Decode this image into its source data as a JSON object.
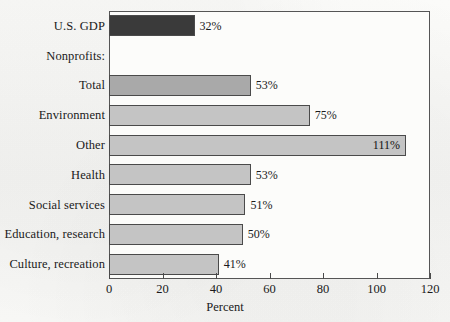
{
  "chart_data": {
    "type": "bar",
    "orientation": "horizontal",
    "title": "",
    "subtitle": "",
    "xlabel": "Percent",
    "ylabel": "",
    "xlim": [
      0,
      120
    ],
    "xticks": [
      0,
      20,
      40,
      60,
      80,
      100,
      120
    ],
    "xtick_labels": [
      "0",
      "20",
      "40",
      "60",
      "80",
      "100",
      "120"
    ],
    "grid": false,
    "legend": false,
    "categories": [
      "U.S. GDP",
      "Nonprofits:",
      "Total",
      "Environment",
      "Other",
      "Health",
      "Social services",
      "Education, research",
      "Culture, recreation"
    ],
    "values": [
      32,
      null,
      53,
      75,
      111,
      53,
      51,
      50,
      41
    ],
    "value_labels": [
      "32%",
      "",
      "53%",
      "75%",
      "111%",
      "53%",
      "51%",
      "50%",
      "41%"
    ],
    "bars": [
      {
        "label": "U.S. GDP",
        "value": 32,
        "value_label": "32%",
        "color": "#3a3a3a",
        "label_position": "outside",
        "is_header": false
      },
      {
        "label": "Nonprofits:",
        "value": null,
        "value_label": "",
        "color": "",
        "label_position": "none",
        "is_header": true
      },
      {
        "label": "Total",
        "value": 53,
        "value_label": "53%",
        "color": "#a9a9a9",
        "label_position": "outside",
        "is_header": false
      },
      {
        "label": "Environment",
        "value": 75,
        "value_label": "75%",
        "color": "#c4c4c4",
        "label_position": "outside",
        "is_header": false
      },
      {
        "label": "Other",
        "value": 111,
        "value_label": "111%",
        "color": "#c4c4c4",
        "label_position": "inside",
        "is_header": false
      },
      {
        "label": "Health",
        "value": 53,
        "value_label": "53%",
        "color": "#c4c4c4",
        "label_position": "outside",
        "is_header": false
      },
      {
        "label": "Social services",
        "value": 51,
        "value_label": "51%",
        "color": "#c4c4c4",
        "label_position": "outside",
        "is_header": false
      },
      {
        "label": "Education, research",
        "value": 50,
        "value_label": "50%",
        "color": "#c4c4c4",
        "label_position": "outside",
        "is_header": false
      },
      {
        "label": "Culture, recreation",
        "value": 41,
        "value_label": "41%",
        "color": "#c4c4c4",
        "label_position": "outside",
        "is_header": false
      }
    ],
    "colors": {
      "gdp_bar": "#3a3a3a",
      "total_bar": "#a9a9a9",
      "nonprofit_bar": "#c4c4c4",
      "bar_outline": "#4a4a4a",
      "axis": "#555555",
      "background": "#f7f7f5",
      "text": "#1a1a1a"
    }
  }
}
